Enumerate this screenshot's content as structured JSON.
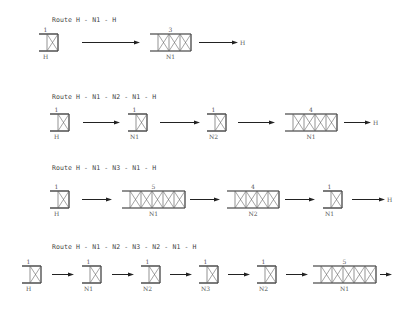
{
  "routes": [
    {
      "title": "Route H - N1 - H",
      "title_pos": [
        52,
        16
      ],
      "row_y": 34,
      "items": [
        {
          "type": "box",
          "x": 39,
          "cells": 1,
          "top": "1",
          "bottom": "H"
        },
        {
          "type": "arrow",
          "x1": 82,
          "x2": 140
        },
        {
          "type": "box",
          "x": 150,
          "cells": 3,
          "top": "3",
          "bottom": "N1"
        },
        {
          "type": "arrow",
          "x1": 199,
          "x2": 238,
          "end_label": "H"
        }
      ]
    },
    {
      "title": "Route H - N1 - N2 - N1 - H",
      "title_pos": [
        52,
        93
      ],
      "row_y": 114,
      "items": [
        {
          "type": "box",
          "x": 50,
          "cells": 1,
          "top": "1",
          "bottom": "H"
        },
        {
          "type": "arrow",
          "x1": 83,
          "x2": 120
        },
        {
          "type": "box",
          "x": 128,
          "cells": 1,
          "top": "1",
          "bottom": "N1"
        },
        {
          "type": "arrow",
          "x1": 160,
          "x2": 200
        },
        {
          "type": "box",
          "x": 207,
          "cells": 1,
          "top": "1",
          "bottom": "N2"
        },
        {
          "type": "arrow",
          "x1": 238,
          "x2": 275
        },
        {
          "type": "box",
          "x": 285,
          "cells": 4,
          "top": "4",
          "bottom": "N1"
        },
        {
          "type": "arrow",
          "x1": 344,
          "x2": 371,
          "end_label": "H"
        }
      ]
    },
    {
      "title": "Route H - N1 - N3 - N1 - H",
      "title_pos": [
        52,
        164
      ],
      "row_y": 191,
      "items": [
        {
          "type": "box",
          "x": 50,
          "cells": 1,
          "top": "1",
          "bottom": "H"
        },
        {
          "type": "arrow",
          "x1": 82,
          "x2": 112
        },
        {
          "type": "box",
          "x": 122,
          "cells": 5,
          "top": "5",
          "bottom": "N1"
        },
        {
          "type": "arrow",
          "x1": 190,
          "x2": 220
        },
        {
          "type": "box",
          "x": 227,
          "cells": 4,
          "top": "4",
          "bottom": "N2"
        },
        {
          "type": "arrow",
          "x1": 285,
          "x2": 315
        },
        {
          "type": "box",
          "x": 323,
          "cells": 1,
          "top": "1",
          "bottom": "N1"
        },
        {
          "type": "arrow",
          "x1": 352,
          "x2": 385,
          "end_label": "H"
        }
      ]
    },
    {
      "title": "Route H - N1 - N2 - N3 - N2 - N1 - H",
      "title_pos": [
        52,
        243
      ],
      "row_y": 266,
      "items": [
        {
          "type": "box",
          "x": 22,
          "cells": 1,
          "top": "1",
          "bottom": "H"
        },
        {
          "type": "arrow",
          "x1": 52,
          "x2": 74
        },
        {
          "type": "box",
          "x": 82,
          "cells": 1,
          "top": "1",
          "bottom": "N1"
        },
        {
          "type": "arrow",
          "x1": 112,
          "x2": 134
        },
        {
          "type": "box",
          "x": 141,
          "cells": 1,
          "top": "1",
          "bottom": "N2"
        },
        {
          "type": "arrow",
          "x1": 170,
          "x2": 192
        },
        {
          "type": "box",
          "x": 199,
          "cells": 1,
          "top": "1",
          "bottom": "N3"
        },
        {
          "type": "arrow",
          "x1": 228,
          "x2": 250
        },
        {
          "type": "box",
          "x": 257,
          "cells": 1,
          "top": "1",
          "bottom": "N2"
        },
        {
          "type": "arrow",
          "x1": 286,
          "x2": 308
        },
        {
          "type": "box",
          "x": 313,
          "cells": 5,
          "top": "5",
          "bottom": "N1"
        },
        {
          "type": "arrow",
          "x1": 380,
          "x2": 392
        }
      ]
    }
  ],
  "style": {
    "line_color": "#222222",
    "cross_color": "#666666",
    "cell_width": 11,
    "box_height": 17,
    "lead_width": 8
  }
}
